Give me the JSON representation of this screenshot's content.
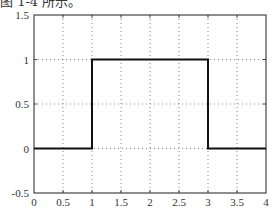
{
  "caption": "图 1-4 所示。",
  "chart_data": {
    "type": "line",
    "title": "",
    "xlabel": "",
    "ylabel": "",
    "xlim": [
      0,
      4
    ],
    "ylim": [
      -0.5,
      1.5
    ],
    "grid": true,
    "grid_style": "dotted",
    "x_ticks": [
      0,
      0.5,
      1,
      1.5,
      2,
      2.5,
      3,
      3.5,
      4
    ],
    "x_tick_labels": [
      "0",
      "0.5",
      "1",
      "1.5",
      "2",
      "2.5",
      "3",
      "3.5",
      "4"
    ],
    "y_ticks": [
      -0.5,
      0,
      0.5,
      1,
      1.5
    ],
    "y_tick_labels": [
      "-0.5",
      "0",
      "0.5",
      "1",
      "1.5"
    ],
    "series": [
      {
        "name": "rectangular pulse",
        "color": "#111111",
        "x": [
          0,
          1,
          1,
          3,
          3,
          4
        ],
        "y": [
          0,
          0,
          1,
          1,
          0,
          0
        ]
      }
    ],
    "legend": null
  }
}
